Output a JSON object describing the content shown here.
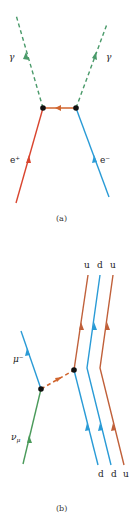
{
  "diagram_a": {
    "caption": "(a)",
    "labels": {
      "photon_left": "γ",
      "photon_right": "γ",
      "positron": "e⁺",
      "electron": "e⁻"
    },
    "colors": {
      "photon": "#4a9a6a",
      "positron": "#d9452f",
      "electron": "#2a9bd6",
      "propagator": "#d0652e",
      "vertex": "#111111"
    }
  },
  "diagram_b": {
    "caption": "(b)",
    "labels": {
      "muon": "μ⁻",
      "neutrino": "ν",
      "neutrino_sub": "μ",
      "top_quarks": [
        "u",
        "d",
        "u"
      ],
      "bottom_quarks": [
        "d",
        "d",
        "u"
      ]
    },
    "colors": {
      "muon": "#2a9bd6",
      "neutrino": "#4a9a5a",
      "w_boson": "#d0652e",
      "up_quark": "#c0603a",
      "down_quark": "#2a9bd6",
      "vertex": "#111111"
    }
  }
}
